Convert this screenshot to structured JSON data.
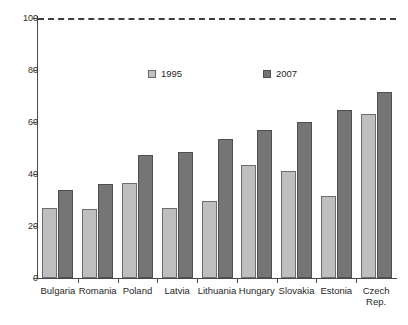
{
  "chart_data": {
    "type": "bar",
    "title": "",
    "subtitle": "",
    "xlabel": "",
    "ylabel": "",
    "ylim": [
      0,
      100
    ],
    "yticks": [
      0,
      20,
      40,
      60,
      80,
      100
    ],
    "ytick_labels": [
      "0",
      "20",
      "40",
      "60",
      "80",
      "100"
    ],
    "grid": false,
    "legend_position": "upper-center",
    "categories": [
      "Bulgaria",
      "Romania",
      "Poland",
      "Latvia",
      "Lithuania",
      "Hungary",
      "Slovakia",
      "Estonia",
      "Czech\nRep."
    ],
    "series": [
      {
        "name": "1995",
        "color": "#bfbfbf",
        "values": [
          27,
          26.5,
          36.5,
          27,
          29.5,
          43.5,
          41,
          31.5,
          63
        ]
      },
      {
        "name": "2007",
        "color": "#757575",
        "values": [
          34,
          36,
          47.5,
          48.5,
          53.5,
          57,
          60,
          64.5,
          71.5
        ]
      }
    ],
    "annotations": [
      {
        "name": "reference-line",
        "type": "hline",
        "value": 100,
        "style": "dashed",
        "color": "#3d3d3d"
      }
    ]
  },
  "legend": {
    "entries": [
      {
        "label": "1995"
      },
      {
        "label": "2007"
      }
    ]
  }
}
